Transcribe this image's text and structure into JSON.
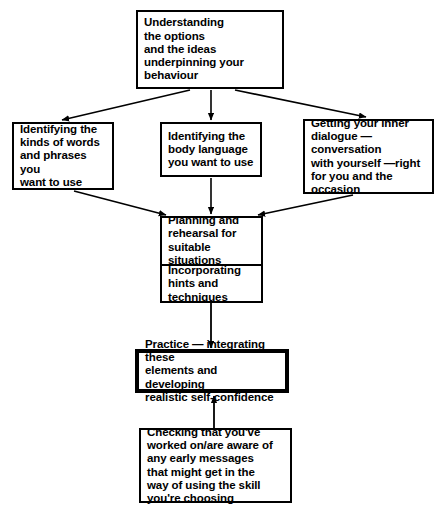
{
  "diagram": {
    "background_color": "#ffffff",
    "line_color": "#000000",
    "nodes": {
      "understanding": {
        "id": "understanding",
        "text": "Understanding\nthe options\nand the ideas\nunderpinning your\nbehaviour"
      },
      "words": {
        "id": "words",
        "text": "Identifying the\nkinds of words\nand phrases you\nwant to use"
      },
      "body_language": {
        "id": "body-language",
        "text": "Identifying the\nbody language\nyou want to use"
      },
      "inner_dialogue": {
        "id": "inner-dialogue",
        "text": "Getting your inner\ndialogue — conversation\nwith yourself —right\nfor you and the\noccasion"
      },
      "planning": {
        "id": "planning",
        "text_top": "Planning and\nrehearsal for\nsuitable\nsituations",
        "text_bottom": "Incorporating\nhints and\ntechniques"
      },
      "practice": {
        "id": "practice",
        "text": "Practice — integrating these\nelements and developing\nrealistic self-confidence",
        "emphasis": "thick-border"
      },
      "checking": {
        "id": "checking",
        "text": "Checking that you've\nworked on/are aware of\nany early messages\nthat might get in the\nway of using the skill\nyou're choosing"
      }
    },
    "connectors": [
      {
        "from": "understanding",
        "to": "words",
        "style": "diagonal-arrow"
      },
      {
        "from": "understanding",
        "to": "body_language",
        "style": "vertical-arrow"
      },
      {
        "from": "understanding",
        "to": "inner_dialogue",
        "style": "diagonal-arrow"
      },
      {
        "from": "words",
        "to": "planning",
        "style": "diagonal-arrow"
      },
      {
        "from": "body_language",
        "to": "planning",
        "style": "vertical-arrow"
      },
      {
        "from": "inner_dialogue",
        "to": "planning",
        "style": "diagonal-arrow"
      },
      {
        "from": "planning",
        "to": "practice",
        "style": "vertical-arrow"
      },
      {
        "from": "checking",
        "to": "practice",
        "style": "vertical-arrow-up"
      }
    ]
  }
}
